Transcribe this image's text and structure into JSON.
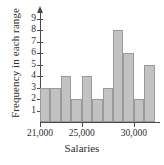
{
  "chart_data": {
    "type": "bar",
    "title": "",
    "xlabel": "Salaries",
    "ylabel": "Frequency in each range",
    "categories": [
      "21,000",
      "22,000",
      "23,000",
      "24,000",
      "25,000",
      "26,000",
      "27,000",
      "28,000",
      "29,000",
      "30,000",
      "31,000"
    ],
    "values": [
      3,
      3,
      4,
      2,
      4,
      2,
      3,
      8,
      6,
      2,
      5
    ],
    "bin_width": 1000,
    "bin_start": 21000,
    "ylim": [
      0,
      9.6
    ],
    "yticks": [
      1,
      2,
      3,
      4,
      5,
      6,
      7,
      8,
      9
    ],
    "ytick_labels": [
      "1",
      "2",
      "3",
      "4",
      "5",
      "6",
      "7",
      "8",
      "9"
    ],
    "xticks": [
      21000,
      25000,
      30000
    ],
    "xtick_labels": [
      "21,000",
      "25,000",
      "30,000"
    ],
    "grid": false,
    "legend": null,
    "bar_color": "#c2c2c2",
    "bar_edge_color": "#9a9a9a",
    "axis_color": "#4a4a4a"
  }
}
